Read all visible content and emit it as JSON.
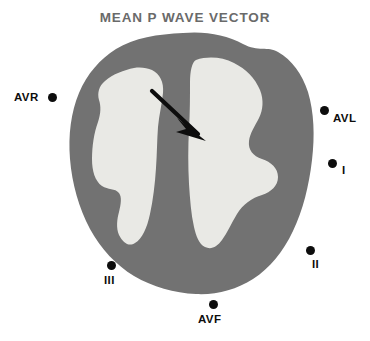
{
  "figure": {
    "title": "MEAN P WAVE VECTOR",
    "colors": {
      "title_text": "#6a6a6a",
      "myocardium": "#727272",
      "chamber": "#e9e9e5",
      "vector_arrow": "#0d0d0d",
      "lead_marker": "#0d0d0d",
      "background": "#ffffff"
    }
  },
  "leads": [
    {
      "id": "avr",
      "label": "AVR",
      "x": 14,
      "y": 91,
      "dot_side": "right"
    },
    {
      "id": "avl",
      "label": "AVL",
      "x": 320,
      "y": 104,
      "dot_side": "left"
    },
    {
      "id": "i",
      "label": "I",
      "x": 328,
      "y": 159,
      "dot_side": "left"
    },
    {
      "id": "ii",
      "label": "II",
      "x": 306,
      "y": 246,
      "dot_side": "left-above"
    },
    {
      "id": "iii",
      "label": "III",
      "x": 104,
      "y": 261,
      "dot_side": "above"
    },
    {
      "id": "avf",
      "label": "AVF",
      "x": 198,
      "y": 300,
      "dot_side": "above"
    }
  ],
  "vector": {
    "name": "mean-p-wave-vector",
    "tail": {
      "x": 152,
      "y": 91
    },
    "tip": {
      "x": 205,
      "y": 140
    },
    "direction": "down-right"
  },
  "anatomy": {
    "outline_label": "heart-cross-section",
    "chambers": [
      "left-chamber",
      "right-chamber"
    ],
    "septum": "interventricular-septum"
  }
}
